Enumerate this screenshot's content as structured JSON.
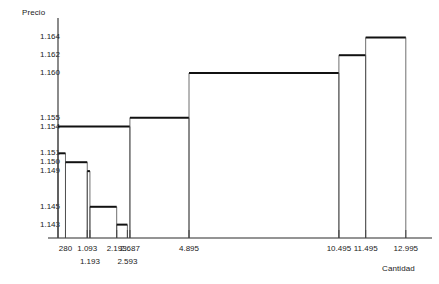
{
  "chart_data": {
    "type": "bar",
    "title": "",
    "ylabel": "Precio",
    "xlabel": "Cantidad",
    "grid": false,
    "legend": "none",
    "ylim": [
      1.1415,
      1.1655
    ],
    "xlim": [
      0,
      13600
    ],
    "y_ticks": [
      "1.164",
      "1.162",
      "1.160",
      "1.155",
      "1.154",
      "1.151",
      "1.150",
      "1.149",
      "1.145",
      "1.143"
    ],
    "y_tick_values": [
      1.164,
      1.162,
      1.16,
      1.155,
      1.154,
      1.151,
      1.15,
      1.149,
      1.145,
      1.143
    ],
    "x_ticks": [
      "280",
      "1.093",
      "1.193",
      "2.193",
      "2.593",
      "2.687",
      "4.895",
      "10.495",
      "11.495",
      "12.995"
    ],
    "x_tick_values": [
      280,
      1093,
      1193,
      2193,
      2593,
      2687,
      4895,
      10495,
      11495,
      12995
    ],
    "series": [
      {
        "name": "Demanda",
        "step": "descending",
        "categories": [
          "280",
          "1.093",
          "1.193",
          "2.193",
          "2.593"
        ],
        "x_start": [
          0,
          280,
          1093,
          1193,
          2193
        ],
        "x_end": [
          280,
          1093,
          1193,
          2193,
          2593
        ],
        "values": [
          1.151,
          1.15,
          1.149,
          1.145,
          1.143
        ]
      },
      {
        "name": "Oferta",
        "step": "ascending",
        "categories": [
          "2.687",
          "4.895",
          "10.495",
          "11.495",
          "12.995"
        ],
        "x_start": [
          0,
          2687,
          4895,
          10495,
          11495
        ],
        "x_end": [
          2687,
          4895,
          10495,
          11495,
          12995
        ],
        "values": [
          1.154,
          1.155,
          1.16,
          1.162,
          1.164
        ]
      }
    ]
  },
  "axes": {
    "y_title": "Precio",
    "x_title": "Cantidad"
  }
}
